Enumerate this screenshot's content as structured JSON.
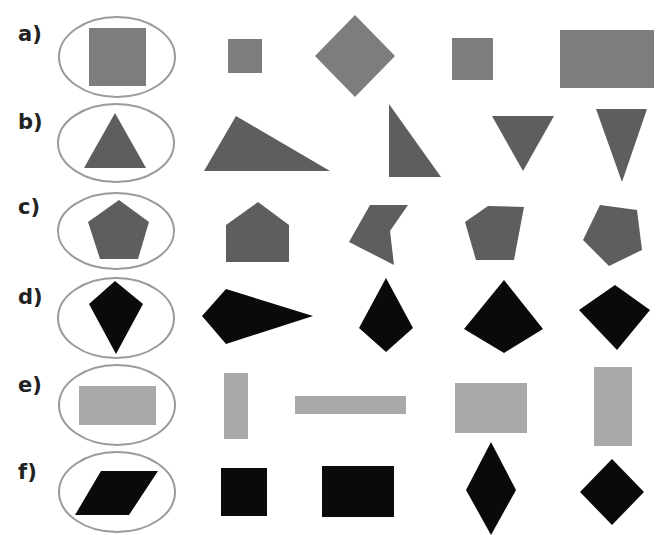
{
  "colors": {
    "ellipse_stroke": "#9a9a9a",
    "medium_gray": "#7d7d7d",
    "dark_gray": "#5e5e5e",
    "black": "#0a0a0a",
    "light_gray": "#a9a9a9"
  },
  "rows": [
    {
      "label": "a)",
      "reference": "square",
      "options": [
        "small square",
        "rotated square (diamond)",
        "small square",
        "rectangle"
      ]
    },
    {
      "label": "b)",
      "reference": "equilateral triangle",
      "options": [
        "obtuse/scalene triangle",
        "right triangle",
        "inverted triangle",
        "tall inverted triangle"
      ]
    },
    {
      "label": "c)",
      "reference": "regular pentagon",
      "options": [
        "house-shaped pentagon",
        "concave pentagon",
        "irregular pentagon",
        "rotated pentagon"
      ]
    },
    {
      "label": "d)",
      "reference": "kite",
      "options": [
        "rotated kite",
        "kite",
        "wide kite",
        "rotated quadrilateral"
      ]
    },
    {
      "label": "e)",
      "reference": "rectangle",
      "options": [
        "tall rectangle",
        "long thin rectangle",
        "rectangle",
        "tall rectangle"
      ]
    },
    {
      "label": "f)",
      "reference": "parallelogram",
      "options": [
        "square",
        "rectangle",
        "tall rhombus",
        "square rotated (diamond)"
      ]
    }
  ]
}
